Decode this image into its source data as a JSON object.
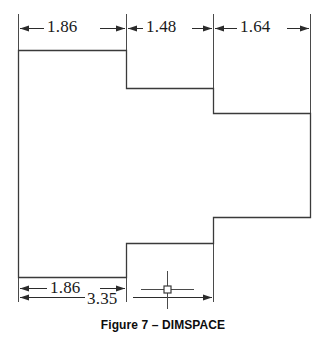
{
  "figure": {
    "caption": "Figure 7 – DIMSPACE",
    "drawing_type": "technical-dimensioned-outline",
    "line_color": "#333333",
    "text_color": "#1a1a1a"
  },
  "dimensions": {
    "top": [
      {
        "name": "dim-top-1",
        "value": "1.86"
      },
      {
        "name": "dim-top-2",
        "value": "1.48"
      },
      {
        "name": "dim-top-3",
        "value": "1.64"
      }
    ],
    "bottom": [
      {
        "name": "dim-bottom-1",
        "value": "1.86"
      },
      {
        "name": "dim-bottom-2",
        "value": "3.35"
      }
    ]
  },
  "geometry": {
    "outline_points": "18,50 126,50 126,88 213,88 213,113 310,113 310,217 213,217 213,243 126,243 126,277 18,277",
    "center_mark": {
      "x": 167,
      "y": 290
    }
  }
}
